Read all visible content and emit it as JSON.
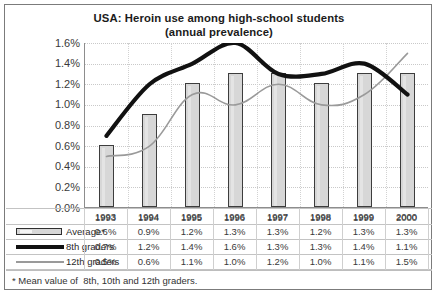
{
  "chart_data": {
    "type": "bar",
    "title": "USA:  Heroin use among high-school students",
    "subtitle": "(annual prevalence)",
    "xlabel": "",
    "ylabel": "",
    "ylim": [
      0.0,
      1.6
    ],
    "ytick_step": 0.2,
    "grid": true,
    "legend_position": "bottom-table",
    "categories": [
      "1993",
      "1994",
      "1995",
      "1996",
      "1997",
      "1998",
      "1999",
      "2000"
    ],
    "ytick_labels": [
      "1.6%",
      "1.4%",
      "1.2%",
      "1.0%",
      "0.8%",
      "0.6%",
      "0.4%",
      "0.2%",
      "0.0%"
    ],
    "ytick_values": [
      1.6,
      1.4,
      1.2,
      1.0,
      0.8,
      0.6,
      0.4,
      0.2,
      0.0
    ],
    "series": [
      {
        "name": "Average*",
        "render": "bar",
        "color": "#d7d7d7",
        "border_color": "#3d3d3d",
        "values": [
          0.6,
          0.9,
          1.2,
          1.3,
          1.3,
          1.2,
          1.3,
          1.3
        ],
        "labels": [
          "0.6%",
          "0.9%",
          "1.2%",
          "1.3%",
          "1.3%",
          "1.2%",
          "1.3%",
          "1.3%"
        ]
      },
      {
        "name": "8th graders",
        "render": "line-thick",
        "color": "#111111",
        "values": [
          0.7,
          1.2,
          1.4,
          1.6,
          1.3,
          1.3,
          1.4,
          1.1
        ],
        "labels": [
          "0.7%",
          "1.2%",
          "1.4%",
          "1.6%",
          "1.3%",
          "1.3%",
          "1.4%",
          "1.1%"
        ]
      },
      {
        "name": "12th graders",
        "render": "line-thin",
        "color": "#9a9a9a",
        "values": [
          0.5,
          0.6,
          1.1,
          1.0,
          1.2,
          1.0,
          1.1,
          1.5
        ],
        "labels": [
          "0.5%",
          "0.6%",
          "1.1%",
          "1.0%",
          "1.2%",
          "1.0%",
          "1.1%",
          "1.5%"
        ]
      }
    ],
    "footnote": "* Mean value of  8th, 10th and 12th graders."
  },
  "ui": {
    "title_line1": "USA:  Heroin use among high-school students",
    "title_line2": "(annual prevalence)",
    "footnote": "* Mean value of  8th, 10th and 12th graders."
  }
}
